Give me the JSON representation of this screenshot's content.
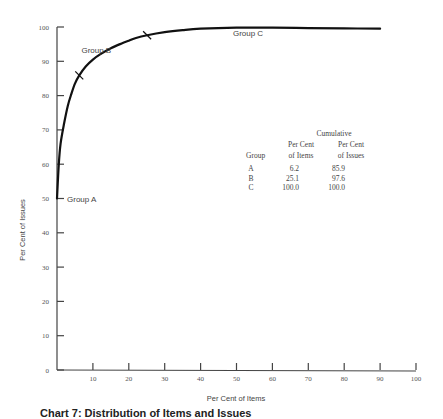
{
  "chart_data": {
    "type": "line",
    "title": "",
    "caption": "Chart 7: Distribution of Items and Issues",
    "xlabel": "Per Cent of Items",
    "ylabel": "Per Cent of Issues",
    "xlim": [
      0,
      100
    ],
    "ylim": [
      0,
      100
    ],
    "x_ticks": [
      10,
      20,
      30,
      40,
      50,
      60,
      70,
      80,
      90,
      100
    ],
    "y_ticks": [
      0,
      10,
      20,
      30,
      40,
      50,
      60,
      70,
      80,
      90,
      100
    ],
    "grid": false,
    "series": [
      {
        "name": "Cumulative Distribution",
        "x": [
          0,
          0.5,
          1,
          2,
          3,
          4,
          5,
          6.2,
          8,
          10,
          12,
          15,
          18,
          20,
          22,
          25.1,
          30,
          35,
          40,
          50,
          60,
          70,
          80,
          90
        ],
        "y": [
          50,
          60,
          66,
          72,
          77,
          80.5,
          83.5,
          85.9,
          88.5,
          90.5,
          92,
          93.8,
          95.2,
          96,
          96.8,
          97.6,
          98.5,
          99.1,
          99.5,
          99.8,
          99.8,
          99.7,
          99.6,
          99.5
        ]
      }
    ],
    "markers": [
      {
        "x": 6.2,
        "y": 85.9,
        "label": "A/B boundary"
      },
      {
        "x": 25.1,
        "y": 97.6,
        "label": "B/C boundary"
      }
    ],
    "annotations": [
      {
        "text": "Group A",
        "x": 3,
        "y": 50
      },
      {
        "text": "Group B",
        "x": 8,
        "y": 92
      },
      {
        "text": "Group C",
        "x": 50,
        "y": 97
      }
    ],
    "table": {
      "header_group": "Cumulative",
      "columns": [
        "Group",
        "Per Cent of Items",
        "Per Cent of Issues"
      ],
      "column_lines": [
        [
          "Group"
        ],
        [
          "Per Cent",
          "of Items"
        ],
        [
          "Per Cent",
          "of Issues"
        ]
      ],
      "rows": [
        [
          "A",
          "6.2",
          "85.9"
        ],
        [
          "B",
          "25.1",
          "97.6"
        ],
        [
          "C",
          "100.0",
          "100.0"
        ]
      ]
    }
  }
}
